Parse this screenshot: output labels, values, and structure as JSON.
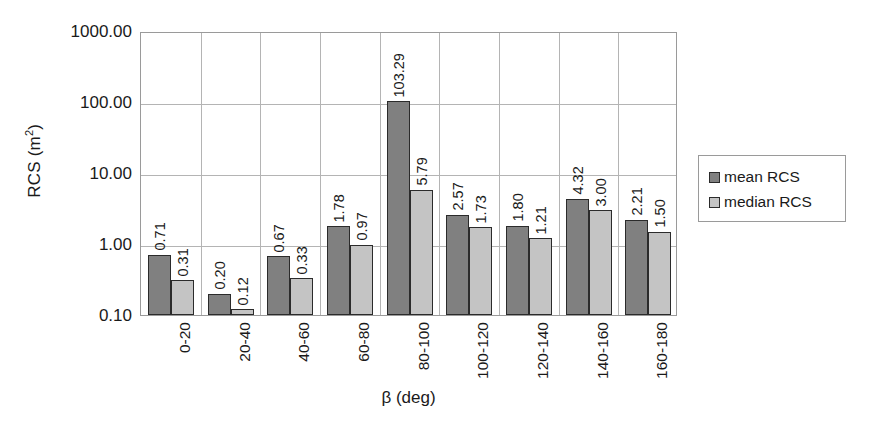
{
  "chart_data": {
    "type": "bar",
    "title": "",
    "subtitle": "",
    "xlabel": "β (deg)",
    "ylabel": "RCS (m²)",
    "yscale": "log",
    "ylim": [
      0.1,
      1000.0
    ],
    "ytick_labels": [
      "1000.00",
      "100.00",
      "10.00",
      "1.00",
      "0.10"
    ],
    "ytick_values": [
      1000,
      100,
      10,
      1,
      0.1
    ],
    "grid": "horizontal-and-vertical",
    "legend_position": "right",
    "categories": [
      "0-20",
      "20-40",
      "40-60",
      "60-80",
      "80-100",
      "100-120",
      "120-140",
      "140-160",
      "160-180"
    ],
    "series": [
      {
        "name": "mean RCS",
        "color": "#808080",
        "values": [
          0.71,
          0.2,
          0.67,
          1.78,
          103.29,
          2.57,
          1.8,
          4.32,
          2.21
        ],
        "labels": [
          "0.71",
          "0.20",
          "0.67",
          "1.78",
          "103.29",
          "2.57",
          "1.80",
          "4.32",
          "2.21"
        ]
      },
      {
        "name": "median RCS",
        "color": "#c4c4c4",
        "values": [
          0.31,
          0.12,
          0.33,
          0.97,
          5.79,
          1.73,
          1.21,
          3.0,
          1.5
        ],
        "labels": [
          "0.31",
          "0.12",
          "0.33",
          "0.97",
          "5.79",
          "1.73",
          "1.21",
          "3.00",
          "1.50"
        ]
      }
    ]
  },
  "legend": {
    "entries": [
      {
        "label": "mean RCS",
        "swatch": "mean"
      },
      {
        "label": "median RCS",
        "swatch": "median"
      }
    ]
  },
  "axis": {
    "y_title_main": "RCS (m",
    "y_title_sup": "2",
    "y_title_tail": ")",
    "x_title": "β (deg)"
  },
  "colors": {
    "mean_bar": "#808080",
    "median_bar": "#c4c4c4",
    "bar_outline": "#2b2b2b",
    "gridline": "#b4b4b4",
    "axis": "#9a9a9a",
    "text": "#1a1a1a",
    "background": "#ffffff"
  }
}
